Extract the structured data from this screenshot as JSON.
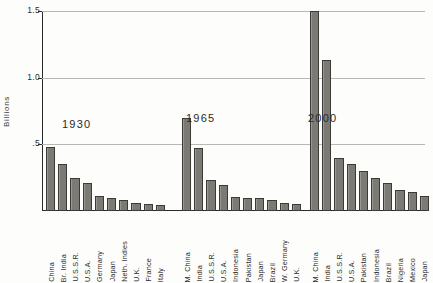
{
  "chart_data": {
    "type": "bar",
    "title": "",
    "subtitle": "",
    "xlabel": "",
    "ylabel": "Billions",
    "ylim": [
      0,
      1.5
    ],
    "ytick_labels": [
      "1.5",
      "1.0",
      ".5"
    ],
    "ytick_values": [
      1.5,
      1.0,
      0.5
    ],
    "grid": true,
    "legend": "none",
    "groups": [
      {
        "name": "1930",
        "categories": [
          "China",
          "Br. India",
          "U.S.S.R.",
          "U.S.A.",
          "Germany",
          "Japan",
          "Neth. Indies",
          "U.K.",
          "France",
          "Italy"
        ],
        "values": [
          0.48,
          0.35,
          0.25,
          0.21,
          0.11,
          0.1,
          0.085,
          0.06,
          0.05,
          0.042
        ]
      },
      {
        "name": "1965",
        "categories": [
          "M. China",
          "India",
          "U.S.S.R.",
          "U.S.A.",
          "Indonesia",
          "Pakistan",
          "Japan",
          "Brazil",
          "W. Germany",
          "U.K."
        ],
        "values": [
          0.7,
          0.47,
          0.23,
          0.195,
          0.105,
          0.1,
          0.098,
          0.082,
          0.057,
          0.055
        ]
      },
      {
        "name": "2000",
        "categories": [
          "M. China",
          "India",
          "U.S.S.R.",
          "U.S.A.",
          "Pakistan",
          "Indonesia",
          "Brazil",
          "Nigeria",
          "Mexico",
          "Japan"
        ],
        "values": [
          1.5,
          1.13,
          0.4,
          0.35,
          0.3,
          0.25,
          0.21,
          0.16,
          0.14,
          0.115
        ]
      }
    ]
  },
  "style": {
    "bar_fill": "#7c7a74",
    "bar_stroke": "#3b3a36",
    "axis_color": "#2a2a28",
    "grid_color": "#b9b9b4",
    "background": "#fdfdfb"
  }
}
